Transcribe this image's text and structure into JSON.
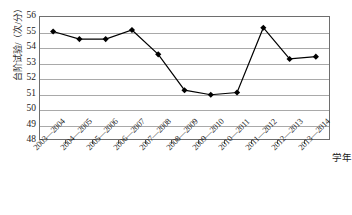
{
  "chart_data": {
    "type": "line",
    "title": "",
    "xlabel": "学年",
    "ylabel": "台阶试验/（次/分）",
    "categories": [
      "2003—2004",
      "2004—2005",
      "2005—2006",
      "2006—2007",
      "2007—2008",
      "2008—2009",
      "2009—2010",
      "2010—2011",
      "2011—2012",
      "2012—2013",
      "2013—2014"
    ],
    "values": [
      55.05,
      54.55,
      54.55,
      55.15,
      53.55,
      51.2,
      50.9,
      51.05,
      55.3,
      53.25,
      53.4
    ],
    "ylim": [
      48,
      56
    ],
    "ytick_step": 1,
    "yticks": [
      "56",
      "55",
      "54",
      "53",
      "52",
      "51",
      "50",
      "49",
      "48"
    ],
    "grid": true,
    "legend": "none",
    "series_name": "台阶试验指数",
    "marker": "diamond",
    "line_color": "#000000",
    "marker_color": "#000000",
    "grid_color": "#a9a9a9",
    "border_color": "#6e6e6e"
  }
}
